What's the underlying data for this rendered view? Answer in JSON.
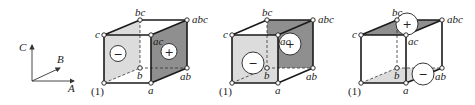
{
  "axes": {
    "labels": {
      "A": "A",
      "B": "B",
      "C": "C"
    }
  },
  "colors": {
    "light_face": "#dcdcdc",
    "dark_face": "#8f8f8f",
    "edge": "#1a1a1a"
  },
  "vertex_labels": {
    "one": "(1)",
    "a": "a",
    "b": "b",
    "ab": "ab",
    "c": "c",
    "ac": "ac",
    "bc": "bc",
    "abc": "abc"
  },
  "cubes": [
    {
      "name": "cube-main-effect-a",
      "light_face": "left (1),b,bc,c",
      "dark_face": "right a,ab,abc,ac",
      "signs": [
        {
          "symbol": "−",
          "face": "left"
        },
        {
          "symbol": "+",
          "face": "right"
        }
      ]
    },
    {
      "name": "cube-main-effect-b",
      "light_face": "front (1),a,ac,c",
      "dark_face": "back b,ab,abc,bc",
      "signs": [
        {
          "symbol": "−",
          "face": "front"
        },
        {
          "symbol": "+",
          "face": "back"
        }
      ]
    },
    {
      "name": "cube-main-effect-c",
      "light_face": "bottom (1),a,ab,b",
      "dark_face": "top c,ac,abc,bc",
      "signs": [
        {
          "symbol": "+",
          "face": "top"
        },
        {
          "symbol": "−",
          "face": "bottom"
        }
      ]
    }
  ]
}
